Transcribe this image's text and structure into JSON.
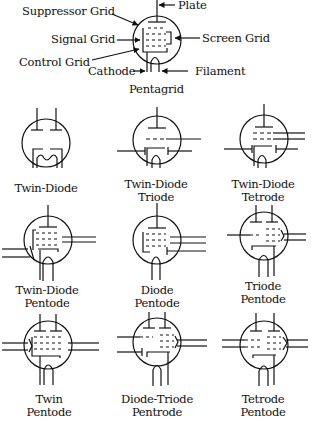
{
  "pentagrid": {
    "name": "Pentagrid",
    "labels": {
      "plate": "Plate",
      "suppressor_grid": "Suppressor Grid",
      "signal_grid": "Signal Grid",
      "screen_grid": "Screen Grid",
      "control_grid": "Control Grid",
      "cathode": "Cathode",
      "filament": "Filament"
    }
  },
  "tubes": [
    {
      "id": "twin-diode",
      "line1": "Twin-Diode",
      "line2": ""
    },
    {
      "id": "twin-diode-triode",
      "line1": "Twin-Diode",
      "line2": "Triode"
    },
    {
      "id": "twin-diode-tetrode",
      "line1": "Twin-Diode",
      "line2": "Tetrode"
    },
    {
      "id": "twin-diode-pentode",
      "line1": "Twin-Diode",
      "line2": "Pentode"
    },
    {
      "id": "diode-pentode",
      "line1": "Diode",
      "line2": "Pentode"
    },
    {
      "id": "triode-pentode",
      "line1": "Triode",
      "line2": "Pentode"
    },
    {
      "id": "twin-pentode",
      "line1": "Twin",
      "line2": "Pentode"
    },
    {
      "id": "diode-triode-pentrode",
      "line1": "Diode-Triode",
      "line2": "Pentrode"
    },
    {
      "id": "tetrode-pentode",
      "line1": "Tetrode",
      "line2": "Pentode"
    }
  ],
  "colors": {
    "ink": "#111111",
    "background": "#ffffff"
  }
}
